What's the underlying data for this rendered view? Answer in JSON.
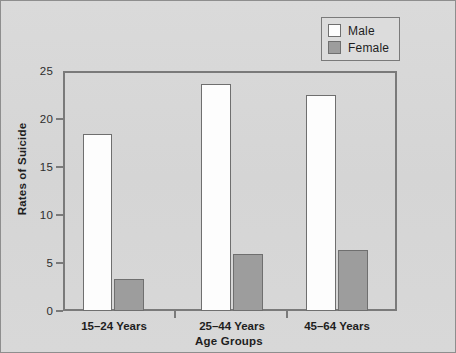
{
  "chart_data": {
    "type": "bar",
    "title": "",
    "subtitle": "",
    "xlabel": "Age Groups",
    "ylabel": "Rates of Suicide",
    "categories": [
      "15–24 Years",
      "25–44 Years",
      "45–64 Years"
    ],
    "series": [
      {
        "name": "Male",
        "color": "#fdfdfd",
        "values": [
          18.4,
          23.6,
          22.5
        ]
      },
      {
        "name": "Female",
        "color": "#9d9d9d",
        "values": [
          3.3,
          5.9,
          6.4
        ]
      }
    ],
    "ylim": [
      0,
      25
    ],
    "yticks": [
      0,
      5,
      10,
      15,
      20,
      25
    ],
    "ytick_labels": [
      "0",
      "5",
      "10",
      "15",
      "20",
      "25"
    ],
    "grid": false,
    "legend_position": "top-right",
    "legend_entries": [
      "Male",
      "Female"
    ],
    "annotations": []
  },
  "figure": {
    "background_color": "#d7d7d7",
    "frame_color": "#7a7a7a",
    "bar_outline_color": "#6f6f6f"
  }
}
